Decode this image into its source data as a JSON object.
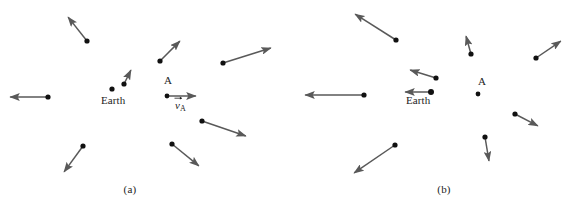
{
  "figure": {
    "type": "physics-vector-diagram",
    "stroke_color": "#595959",
    "dot_color": "#111111",
    "background": "#ffffff",
    "width": 576,
    "height": 210
  },
  "panels": [
    {
      "id": "a",
      "caption": "(a)",
      "caption_x": 130,
      "caption_y": 190,
      "origin_label": "Earth",
      "origin_label_x": 101,
      "origin_label_y": 94,
      "origin_dot": {
        "x": 112,
        "y": 89,
        "r": 2.6
      },
      "point_a_label": "A",
      "point_a_label_x": 164,
      "point_a_label_y": 74,
      "point_a_dot": {
        "x": 167,
        "y": 96,
        "r": 2.4
      },
      "velocity_label": "v",
      "velocity_label_sub": "A",
      "velocity_label_x": 175,
      "velocity_label_y": 99,
      "vectors": [
        {
          "name": "galaxy-upper-left",
          "x1": 87,
          "y1": 41,
          "x2": 68,
          "y2": 17
        },
        {
          "name": "galaxy-left",
          "x1": 48,
          "y1": 97,
          "x2": 10,
          "y2": 97
        },
        {
          "name": "galaxy-lower-left",
          "x1": 83,
          "y1": 146,
          "x2": 64,
          "y2": 172
        },
        {
          "name": "galaxy-inner-upper",
          "x1": 124,
          "y1": 84,
          "x2": 131,
          "y2": 70
        },
        {
          "name": "galaxy-upper-mid",
          "x1": 160,
          "y1": 61,
          "x2": 180,
          "y2": 41
        },
        {
          "name": "galaxy-upper-right",
          "x1": 223,
          "y1": 63,
          "x2": 271,
          "y2": 48
        },
        {
          "name": "galaxy-a-velocity",
          "x1": 167,
          "y1": 96,
          "x2": 196,
          "y2": 96
        },
        {
          "name": "galaxy-lower-right",
          "x1": 202,
          "y1": 121,
          "x2": 246,
          "y2": 136
        },
        {
          "name": "galaxy-lower-mid",
          "x1": 172,
          "y1": 144,
          "x2": 199,
          "y2": 166
        }
      ]
    },
    {
      "id": "b",
      "caption": "(b)",
      "caption_x": 444,
      "caption_y": 190,
      "origin_label": "Earth",
      "origin_label_x": 406,
      "origin_label_y": 94,
      "origin_dot": {
        "x": 431,
        "y": 92,
        "r": 3.0
      },
      "point_a_label": "A",
      "point_a_label_x": 478,
      "point_a_label_y": 75,
      "point_a_dot": {
        "x": 478,
        "y": 94,
        "r": 2.4
      },
      "vectors": [
        {
          "name": "galaxy-upper-left",
          "x1": 396,
          "y1": 40,
          "x2": 355,
          "y2": 14
        },
        {
          "name": "galaxy-mid-left",
          "x1": 436,
          "y1": 78,
          "x2": 410,
          "y2": 70
        },
        {
          "name": "galaxy-left",
          "x1": 364,
          "y1": 95,
          "x2": 305,
          "y2": 95
        },
        {
          "name": "earth-velocity",
          "x1": 431,
          "y1": 92,
          "x2": 405,
          "y2": 92
        },
        {
          "name": "galaxy-lower-left",
          "x1": 395,
          "y1": 145,
          "x2": 354,
          "y2": 173
        },
        {
          "name": "galaxy-upper-mid",
          "x1": 471,
          "y1": 54,
          "x2": 466,
          "y2": 36
        },
        {
          "name": "galaxy-upper-right",
          "x1": 536,
          "y1": 58,
          "x2": 561,
          "y2": 41
        },
        {
          "name": "galaxy-lower-right",
          "x1": 515,
          "y1": 114,
          "x2": 538,
          "y2": 126
        },
        {
          "name": "galaxy-lower-mid",
          "x1": 485,
          "y1": 137,
          "x2": 489,
          "y2": 161
        }
      ]
    }
  ]
}
